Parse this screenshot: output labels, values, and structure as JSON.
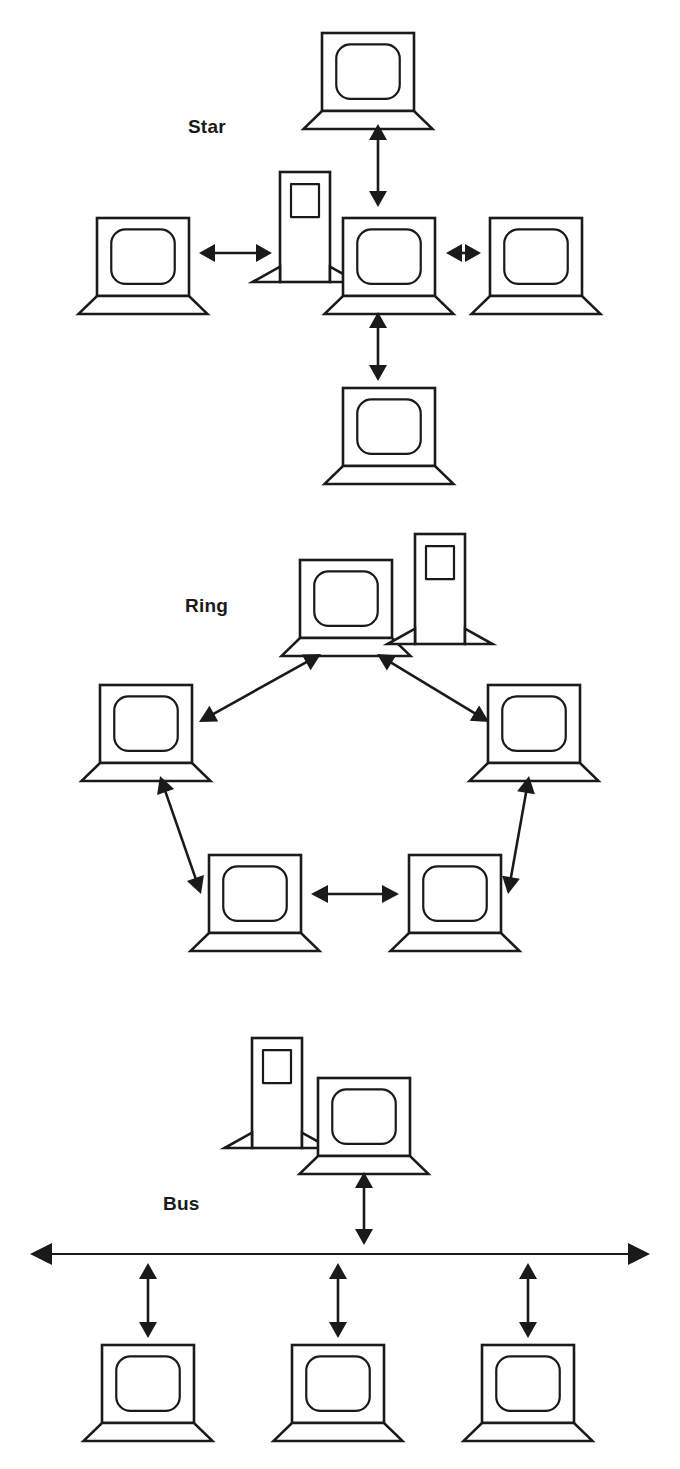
{
  "page": {
    "background_color": "#ffffff",
    "stroke_color": "#1a1a1a",
    "width": 680,
    "height": 1469
  },
  "sections": [
    {
      "id": "star",
      "label": "Star",
      "label_x": 188,
      "label_y": 133,
      "description": "Star topology: four laptops connected to a central laptop with adjacent server tower",
      "devices": [
        {
          "name": "star-laptop-top",
          "type": "laptop",
          "x": 322,
          "y": 33,
          "w": 92,
          "h": 78
        },
        {
          "name": "star-laptop-left",
          "type": "laptop",
          "x": 97,
          "y": 218,
          "w": 92,
          "h": 78
        },
        {
          "name": "star-server-center",
          "type": "server",
          "x": 280,
          "y": 172,
          "w": 50,
          "h": 110
        },
        {
          "name": "star-laptop-center",
          "type": "laptop",
          "x": 343,
          "y": 218,
          "w": 92,
          "h": 78
        },
        {
          "name": "star-laptop-right",
          "type": "laptop",
          "x": 490,
          "y": 218,
          "w": 92,
          "h": 78
        },
        {
          "name": "star-laptop-bottom",
          "type": "laptop",
          "x": 343,
          "y": 388,
          "w": 92,
          "h": 78
        }
      ],
      "links": [
        {
          "name": "star-link-top",
          "from": "star-laptop-center",
          "to": "star-laptop-top",
          "x1": 378,
          "y1": 207,
          "x2": 378,
          "y2": 124,
          "arrows": "both"
        },
        {
          "name": "star-link-left",
          "from": "star-server-center",
          "to": "star-laptop-left",
          "x1": 272,
          "y1": 253,
          "x2": 199,
          "y2": 253,
          "arrows": "both"
        },
        {
          "name": "star-link-right",
          "from": "star-laptop-center",
          "to": "star-laptop-right",
          "x1": 446,
          "y1": 253,
          "x2": 481,
          "y2": 253,
          "arrows": "both"
        },
        {
          "name": "star-link-bottom",
          "from": "star-laptop-center",
          "to": "star-laptop-bottom",
          "x1": 378,
          "y1": 312,
          "x2": 378,
          "y2": 381,
          "arrows": "both"
        }
      ]
    },
    {
      "id": "ring",
      "label": "Ring",
      "label_x": 185,
      "label_y": 612,
      "description": "Ring topology: five laptops in a pentagon loop, server tower beside the top laptop",
      "devices": [
        {
          "name": "ring-laptop-top",
          "type": "laptop",
          "x": 300,
          "y": 560,
          "w": 92,
          "h": 78
        },
        {
          "name": "ring-server-top",
          "type": "server",
          "x": 415,
          "y": 534,
          "w": 50,
          "h": 110
        },
        {
          "name": "ring-laptop-left",
          "type": "laptop",
          "x": 100,
          "y": 685,
          "w": 92,
          "h": 78
        },
        {
          "name": "ring-laptop-right",
          "type": "laptop",
          "x": 488,
          "y": 685,
          "w": 92,
          "h": 78
        },
        {
          "name": "ring-laptop-bottom-left",
          "type": "laptop",
          "x": 209,
          "y": 855,
          "w": 92,
          "h": 78
        },
        {
          "name": "ring-laptop-bottom-right",
          "type": "laptop",
          "x": 409,
          "y": 855,
          "w": 92,
          "h": 78
        }
      ],
      "links": [
        {
          "name": "ring-link-left-top",
          "from": "ring-laptop-left",
          "to": "ring-laptop-top",
          "x1": 199,
          "y1": 722,
          "x2": 321,
          "y2": 654,
          "arrows": "both"
        },
        {
          "name": "ring-link-top-right",
          "from": "ring-laptop-top",
          "to": "ring-laptop-right",
          "x1": 377,
          "y1": 654,
          "x2": 489,
          "y2": 722,
          "arrows": "both"
        },
        {
          "name": "ring-link-bottomleft-left",
          "from": "ring-laptop-bottom-left",
          "to": "ring-laptop-left",
          "x1": 201,
          "y1": 894,
          "x2": 160,
          "y2": 776,
          "arrows": "both"
        },
        {
          "name": "ring-link-right-bottomright",
          "from": "ring-laptop-right",
          "to": "ring-laptop-bottom-right",
          "x1": 529,
          "y1": 776,
          "x2": 508,
          "y2": 894,
          "arrows": "both"
        },
        {
          "name": "ring-link-bottom-horizontal",
          "from": "ring-laptop-bottom-left",
          "to": "ring-laptop-bottom-right",
          "x1": 311,
          "y1": 894,
          "x2": 399,
          "y2": 894,
          "arrows": "both"
        }
      ]
    },
    {
      "id": "bus",
      "label": "Bus",
      "label_x": 163,
      "label_y": 1210,
      "description": "Bus topology: horizontal backbone with double-headed arrows to one server-plus-laptop cluster above and three laptops below",
      "backbone": {
        "name": "bus-backbone-line",
        "x1": 30,
        "x2": 650,
        "y": 1254,
        "arrows": "both"
      },
      "devices": [
        {
          "name": "bus-server-top",
          "type": "server",
          "x": 252,
          "y": 1038,
          "w": 50,
          "h": 110
        },
        {
          "name": "bus-laptop-top",
          "type": "laptop",
          "x": 318,
          "y": 1078,
          "w": 92,
          "h": 78
        },
        {
          "name": "bus-laptop-bottom-1",
          "type": "laptop",
          "x": 102,
          "y": 1345,
          "w": 92,
          "h": 78
        },
        {
          "name": "bus-laptop-bottom-2",
          "type": "laptop",
          "x": 292,
          "y": 1345,
          "w": 92,
          "h": 78
        },
        {
          "name": "bus-laptop-bottom-3",
          "type": "laptop",
          "x": 482,
          "y": 1345,
          "w": 92,
          "h": 78
        }
      ],
      "links": [
        {
          "name": "bus-link-top",
          "from": "bus-laptop-top",
          "to": "bus-backbone-line",
          "x1": 364,
          "y1": 1172,
          "x2": 364,
          "y2": 1245,
          "arrows": "both"
        },
        {
          "name": "bus-link-bottom-1",
          "from": "bus-backbone-line",
          "to": "bus-laptop-bottom-1",
          "x1": 148,
          "y1": 1263,
          "x2": 148,
          "y2": 1338,
          "arrows": "both"
        },
        {
          "name": "bus-link-bottom-2",
          "from": "bus-backbone-line",
          "to": "bus-laptop-bottom-2",
          "x1": 338,
          "y1": 1263,
          "x2": 338,
          "y2": 1338,
          "arrows": "both"
        },
        {
          "name": "bus-link-bottom-3",
          "from": "bus-backbone-line",
          "to": "bus-laptop-bottom-3",
          "x1": 528,
          "y1": 1263,
          "x2": 528,
          "y2": 1338,
          "arrows": "both"
        }
      ]
    }
  ]
}
